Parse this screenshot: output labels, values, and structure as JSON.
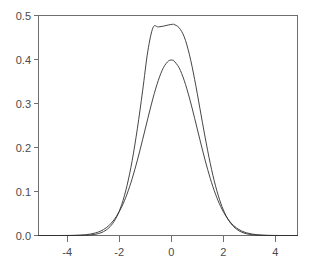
{
  "figure": {
    "kind": "density-plot",
    "background_color": "#ffffff",
    "axis_color": "#6e6e6e",
    "curve_color": "#303030",
    "label_color": "#4a4a4a"
  },
  "chart_data": {
    "type": "line",
    "title": "",
    "subtitle": "",
    "xlabel": "",
    "ylabel": "",
    "xlim": [
      -5.1,
      4.85
    ],
    "ylim": [
      0.0,
      0.5
    ],
    "grid": false,
    "legend": null,
    "legend_position": "none",
    "x_ticks": [
      -4,
      -2,
      0,
      2,
      4
    ],
    "x_tick_labels": [
      "-4",
      "-2",
      "0",
      "2",
      "4"
    ],
    "y_ticks": [
      0.0,
      0.1,
      0.2,
      0.3,
      0.4,
      0.5
    ],
    "y_tick_labels": [
      "0.0",
      "0.1",
      "0.2",
      "0.3",
      "0.4",
      "0.5"
    ],
    "x": [
      -5.1,
      -4.9,
      -4.7,
      -4.5,
      -4.3,
      -4.1,
      -3.9,
      -3.7,
      -3.5,
      -3.3,
      -3.1,
      -2.9,
      -2.7,
      -2.5,
      -2.3,
      -2.1,
      -1.9,
      -1.7,
      -1.5,
      -1.3,
      -1.1,
      -0.9,
      -0.7,
      -0.5,
      -0.3,
      -0.1,
      0.05,
      0.1,
      0.3,
      0.5,
      0.7,
      0.9,
      1.1,
      1.3,
      1.5,
      1.7,
      1.9,
      2.1,
      2.3,
      2.5,
      2.7,
      2.9,
      3.1,
      3.3,
      3.5,
      3.7,
      3.9,
      4.1,
      4.3,
      4.5,
      4.7,
      4.85
    ],
    "series": [
      {
        "name": "normal-density-sd1",
        "description": "Standard normal density, mean 0, sd 1, peak 0.399",
        "peak_value": 0.399,
        "peak_x": 0.0,
        "values": [
          0.0,
          0.0,
          0.0,
          0.0,
          0.0,
          0.0001,
          0.0002,
          0.0004,
          0.0009,
          0.0017,
          0.0033,
          0.006,
          0.0104,
          0.0175,
          0.0283,
          0.044,
          0.0656,
          0.094,
          0.1295,
          0.1714,
          0.2179,
          0.2661,
          0.3123,
          0.3521,
          0.3814,
          0.397,
          0.3985,
          0.397,
          0.3814,
          0.3521,
          0.3123,
          0.2661,
          0.2179,
          0.1714,
          0.1295,
          0.094,
          0.0656,
          0.044,
          0.0283,
          0.0175,
          0.0104,
          0.006,
          0.0033,
          0.0017,
          0.0009,
          0.0004,
          0.0002,
          0.0001,
          0.0,
          0.0,
          0.0,
          0.0
        ]
      },
      {
        "name": "normal-density-narrow",
        "description": "Narrower, taller density, mean ~0.05, sd ~0.83, peak 0.48",
        "peak_value": 0.48,
        "peak_x": 0.05,
        "values": [
          0.0,
          0.0,
          0.0,
          0.0,
          0.0,
          0.0,
          0.0,
          0.0001,
          0.0002,
          0.0005,
          0.0013,
          0.0029,
          0.0062,
          0.0124,
          0.0235,
          0.042,
          0.0709,
          0.1132,
          0.1708,
          0.2437,
          0.3288,
          0.4191,
          0.4726,
          0.474,
          0.4758,
          0.4786,
          0.48,
          0.4798,
          0.4723,
          0.4512,
          0.4106,
          0.3543,
          0.2893,
          0.2236,
          0.1634,
          0.1129,
          0.0737,
          0.0455,
          0.0266,
          0.0147,
          0.0077,
          0.0038,
          0.0017,
          0.0008,
          0.0003,
          0.0001,
          0.0,
          0.0,
          0.0,
          0.0,
          0.0,
          0.0
        ]
      }
    ]
  }
}
